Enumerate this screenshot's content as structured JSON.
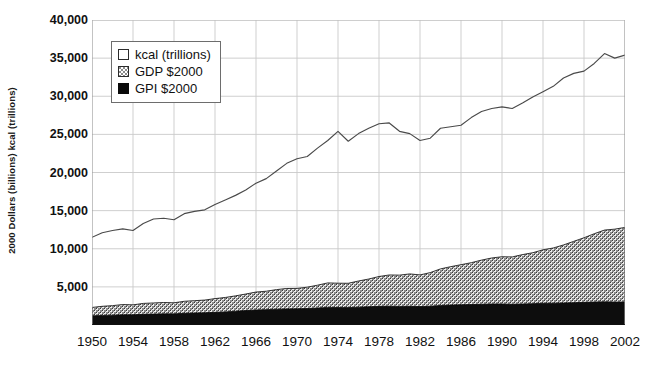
{
  "chart_data": {
    "type": "area",
    "title": "",
    "subtitle": "",
    "xlabel": "",
    "ylabel": "2000 Dollars (billions) kcal (trillions)",
    "xlim": [
      1950,
      2002
    ],
    "ylim": [
      0,
      40000
    ],
    "ytick_interval": 5000,
    "xtick_interval": 4,
    "grid": true,
    "legend_position": "top-left",
    "ytick_labels": [
      "40,000",
      "35,000",
      "30,000",
      "25,000",
      "20,000",
      "15,000",
      "10,000",
      "5,000",
      ""
    ],
    "ytick_values": [
      40000,
      35000,
      30000,
      25000,
      20000,
      15000,
      10000,
      5000,
      0
    ],
    "xtick_labels": [
      "1950",
      "1954",
      "1958",
      "1962",
      "1966",
      "1970",
      "1974",
      "1978",
      "1982",
      "1986",
      "1990",
      "1994",
      "1998",
      "2002"
    ],
    "xtick_values": [
      1950,
      1954,
      1958,
      1962,
      1966,
      1970,
      1974,
      1978,
      1982,
      1986,
      1990,
      1994,
      1998,
      2002
    ],
    "legend": [
      {
        "label": "kcal (trillions)",
        "swatch": "white-outline",
        "color": "#ffffff"
      },
      {
        "label": "GDP $2000",
        "swatch": "checker-gray",
        "color": "#8c8c8c"
      },
      {
        "label": "GPI $2000",
        "swatch": "solid-black",
        "color": "#0a0a0a"
      }
    ],
    "x": [
      1950,
      1951,
      1952,
      1953,
      1954,
      1955,
      1956,
      1957,
      1958,
      1959,
      1960,
      1961,
      1962,
      1963,
      1964,
      1965,
      1966,
      1967,
      1968,
      1969,
      1970,
      1971,
      1972,
      1973,
      1974,
      1975,
      1976,
      1977,
      1978,
      1979,
      1980,
      1981,
      1982,
      1983,
      1984,
      1985,
      1986,
      1987,
      1988,
      1989,
      1990,
      1991,
      1992,
      1993,
      1994,
      1995,
      1996,
      1997,
      1998,
      1999,
      2000,
      2001,
      2002
    ],
    "series": [
      {
        "name": "kcal (trillions)",
        "style": "line",
        "values": [
          11500,
          12100,
          12400,
          12600,
          12400,
          13300,
          13900,
          14000,
          13800,
          14600,
          14900,
          15100,
          15800,
          16400,
          17000,
          17700,
          18600,
          19200,
          20200,
          21200,
          21800,
          22100,
          23200,
          24200,
          25400,
          24100,
          25100,
          25800,
          26400,
          26500,
          25400,
          25100,
          24200,
          24500,
          25800,
          26000,
          26200,
          27200,
          28000,
          28400,
          28600,
          28400,
          29100,
          29900,
          30600,
          31300,
          32400,
          33000,
          33300,
          34300,
          35600,
          35000,
          35400
        ]
      },
      {
        "name": "GDP $2000",
        "style": "stacked-area",
        "values": [
          2300,
          2450,
          2540,
          2680,
          2640,
          2830,
          2890,
          2950,
          2910,
          3110,
          3190,
          3270,
          3460,
          3610,
          3820,
          4060,
          4320,
          4430,
          4640,
          4790,
          4800,
          4960,
          5220,
          5520,
          5480,
          5470,
          5770,
          6030,
          6360,
          6560,
          6540,
          6700,
          6570,
          6870,
          7360,
          7650,
          7910,
          8170,
          8510,
          8790,
          8950,
          8930,
          9230,
          9480,
          9860,
          10100,
          10500,
          10970,
          11440,
          11970,
          12450,
          12570,
          12800
        ]
      },
      {
        "name": "GPI $2000",
        "style": "stacked-area",
        "values": [
          1200,
          1250,
          1290,
          1330,
          1340,
          1400,
          1430,
          1460,
          1460,
          1530,
          1570,
          1600,
          1660,
          1720,
          1800,
          1890,
          1980,
          2010,
          2070,
          2110,
          2120,
          2160,
          2230,
          2310,
          2290,
          2280,
          2340,
          2390,
          2450,
          2470,
          2440,
          2460,
          2420,
          2470,
          2560,
          2610,
          2650,
          2680,
          2720,
          2760,
          2760,
          2720,
          2760,
          2800,
          2850,
          2860,
          2890,
          2930,
          2970,
          3010,
          3040,
          3010,
          3020
        ]
      }
    ]
  },
  "axis": {
    "y_title": "2000 Dollars (billions) kcal (trillions)"
  }
}
